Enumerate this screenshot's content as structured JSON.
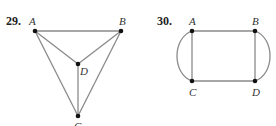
{
  "figures": [
    {
      "number": "29.",
      "vertices": [
        {
          "id": "A",
          "label": "A",
          "x": 35,
          "y": 31
        },
        {
          "id": "B",
          "label": "B",
          "x": 121,
          "y": 31
        },
        {
          "id": "D",
          "label": "D",
          "x": 78,
          "y": 64
        },
        {
          "id": "C",
          "label": "C",
          "x": 78,
          "y": 116
        }
      ],
      "edges": [
        [
          "A",
          "B"
        ],
        [
          "A",
          "D"
        ],
        [
          "B",
          "D"
        ],
        [
          "A",
          "C"
        ],
        [
          "B",
          "C"
        ],
        [
          "D",
          "C"
        ]
      ]
    },
    {
      "number": "30.",
      "vertices": [
        {
          "id": "A",
          "label": "A",
          "x": 192,
          "y": 31
        },
        {
          "id": "B",
          "label": "B",
          "x": 255,
          "y": 31
        },
        {
          "id": "C",
          "label": "C",
          "x": 192,
          "y": 81
        },
        {
          "id": "D",
          "label": "D",
          "x": 255,
          "y": 81
        }
      ],
      "edges": [
        [
          "A",
          "B"
        ],
        [
          "C",
          "D"
        ],
        [
          "A",
          "C"
        ],
        [
          "B",
          "D"
        ],
        [
          "A",
          "C",
          "curved-left"
        ],
        [
          "B",
          "D",
          "curved-right"
        ]
      ]
    }
  ]
}
